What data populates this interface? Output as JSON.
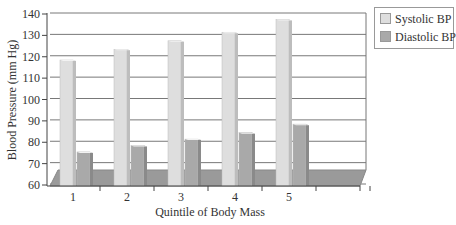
{
  "chart_data": {
    "type": "bar",
    "title": "",
    "xlabel": "Quintile of Body Mass",
    "ylabel": "Blood Pressure (mm Hg)",
    "categories": [
      "1",
      "2",
      "3",
      "4",
      "5"
    ],
    "series": [
      {
        "name": "Systolic BP",
        "values": [
          118,
          123,
          127,
          131,
          137
        ],
        "color": "#dedede"
      },
      {
        "name": "Diastolic BP",
        "values": [
          75,
          78,
          81,
          84,
          88
        ],
        "color": "#a9a9a9"
      }
    ],
    "ylim": [
      60,
      140
    ],
    "yticks": [
      60,
      70,
      80,
      90,
      100,
      110,
      120,
      130,
      140
    ],
    "grid": true,
    "legend_position": "right",
    "style": "3d-clustered-column"
  },
  "legend": {
    "items": [
      {
        "label": "Systolic BP",
        "color": "#dedede"
      },
      {
        "label": "Diastolic BP",
        "color": "#a9a9a9"
      }
    ]
  }
}
